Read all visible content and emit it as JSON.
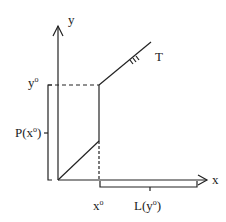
{
  "diagram": {
    "type": "economics-production-graph",
    "axes": {
      "x_label": "x",
      "y_label": "y"
    },
    "curve_label": "T",
    "points": {
      "x0_label": "x",
      "x0_sup": "o",
      "y0_label": "y",
      "y0_sup": "o"
    },
    "brackets": {
      "vertical": {
        "prefix": "P(x",
        "sup": "o",
        "suffix": ")"
      },
      "horizontal": {
        "prefix": "L(y",
        "sup": "o",
        "suffix": ")"
      }
    },
    "colors": {
      "stroke": "#222222",
      "background": "#ffffff"
    }
  }
}
